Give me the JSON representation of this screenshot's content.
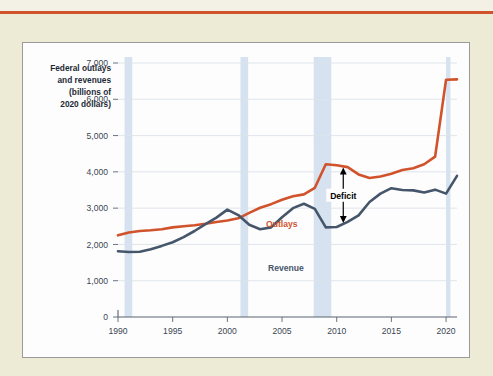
{
  "page": {
    "background_color": "#edead6",
    "rule_color": "#d0532c"
  },
  "panel": {
    "background_color": "#fdfdfd",
    "border_color": "#9a9a9a"
  },
  "chart_data": {
    "type": "line",
    "title": "",
    "ylabel": "Federal outlays and revenues (billions of 2020 dollars)",
    "ylabel_lines": [
      "Federal outlays",
      "and revenues",
      "(billions of",
      "2020 dollars)"
    ],
    "xlabel": "",
    "xlim": [
      1990,
      2021
    ],
    "ylim": [
      0,
      7000
    ],
    "grid": true,
    "grid_color": "#dde3ea",
    "legend_position": "inline-labels",
    "yticks": [
      0,
      1000,
      2000,
      3000,
      4000,
      5000,
      6000,
      7000
    ],
    "ytick_labels": [
      "0",
      "1,000",
      "2,000",
      "3,000",
      "4,000",
      "5,000",
      "6,000",
      "7,000"
    ],
    "xticks": [
      1990,
      1995,
      2000,
      2005,
      2010,
      2015,
      2020
    ],
    "xtick_labels": [
      "1990",
      "1995",
      "2000",
      "2005",
      "2010",
      "2015",
      "2020"
    ],
    "x": [
      1990,
      1991,
      1992,
      1993,
      1994,
      1995,
      1996,
      1997,
      1998,
      1999,
      2000,
      2001,
      2002,
      2003,
      2004,
      2005,
      2006,
      2007,
      2008,
      2009,
      2010,
      2011,
      2012,
      2013,
      2014,
      2015,
      2016,
      2017,
      2018,
      2019,
      2020,
      2021
    ],
    "series": [
      {
        "name": "Outlays",
        "color": "#d0532c",
        "label": "Outlays",
        "label_color": "#d0532c",
        "values": [
          2250,
          2330,
          2370,
          2390,
          2420,
          2470,
          2500,
          2530,
          2570,
          2620,
          2660,
          2720,
          2870,
          3010,
          3110,
          3230,
          3330,
          3380,
          3560,
          4210,
          4180,
          4130,
          3930,
          3830,
          3870,
          3950,
          4050,
          4100,
          4210,
          4420,
          6540,
          6550
        ]
      },
      {
        "name": "Revenue",
        "color": "#46566a",
        "label": "Revenue",
        "label_color": "#46566a",
        "values": [
          1810,
          1790,
          1800,
          1870,
          1960,
          2060,
          2200,
          2370,
          2560,
          2740,
          2960,
          2810,
          2540,
          2420,
          2470,
          2750,
          3000,
          3120,
          2980,
          2470,
          2480,
          2620,
          2800,
          3170,
          3400,
          3550,
          3500,
          3490,
          3430,
          3510,
          3400,
          3890
        ]
      }
    ],
    "recession_bands": [
      {
        "start": 1990.6,
        "end": 1991.3
      },
      {
        "start": 2001.2,
        "end": 2001.9
      },
      {
        "start": 2007.9,
        "end": 2009.5
      },
      {
        "start": 2020.0,
        "end": 2020.4
      }
    ],
    "recession_band_color": "#d6e2ef",
    "annotations": [
      {
        "name": "deficit",
        "text": "Deficit",
        "color": "#000000",
        "x": 2010.6,
        "y_top": 4120,
        "y_bottom": 2590,
        "arrow": "double"
      }
    ]
  }
}
